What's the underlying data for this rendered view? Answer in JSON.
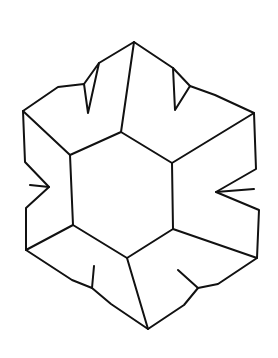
{
  "figure": {
    "stroke_color": "#111111",
    "background": "#ffffff",
    "outline": [
      [
        134,
        42
      ],
      [
        99,
        63
      ],
      [
        88,
        113
      ],
      [
        84,
        84
      ],
      [
        58,
        87
      ],
      [
        23,
        111
      ],
      [
        25,
        162
      ],
      [
        49,
        187
      ],
      [
        26,
        208
      ],
      [
        26,
        250
      ],
      [
        72,
        280
      ],
      [
        92,
        288
      ],
      [
        111,
        304
      ],
      [
        148,
        329
      ],
      [
        184,
        305
      ],
      [
        198,
        288
      ],
      [
        218,
        284
      ],
      [
        257,
        258
      ],
      [
        259,
        210
      ],
      [
        216,
        192
      ],
      [
        256,
        169
      ],
      [
        254,
        113
      ],
      [
        215,
        95
      ],
      [
        190,
        86
      ],
      [
        175,
        110
      ],
      [
        173,
        68
      ]
    ],
    "inner_hexagon": [
      [
        121,
        132
      ],
      [
        172,
        163
      ],
      [
        173,
        229
      ],
      [
        127,
        258
      ],
      [
        73,
        225
      ],
      [
        70,
        155
      ]
    ],
    "spokes": [
      [
        [
          134,
          42
        ],
        [
          121,
          132
        ]
      ],
      [
        [
          23,
          111
        ],
        [
          70,
          155
        ]
      ],
      [
        [
          254,
          113
        ],
        [
          172,
          163
        ]
      ],
      [
        [
          26,
          250
        ],
        [
          73,
          225
        ]
      ],
      [
        [
          257,
          258
        ],
        [
          173,
          229
        ]
      ],
      [
        [
          148,
          329
        ],
        [
          127,
          258
        ]
      ]
    ],
    "notch_lines": [
      [
        [
          84,
          84
        ],
        [
          99,
          63
        ]
      ],
      [
        [
          190,
          86
        ],
        [
          173,
          68
        ]
      ],
      [
        [
          30,
          185
        ],
        [
          49,
          187
        ]
      ],
      [
        [
          254,
          189
        ],
        [
          216,
          192
        ]
      ],
      [
        [
          94,
          266
        ],
        [
          92,
          288
        ]
      ],
      [
        [
          178,
          270
        ],
        [
          198,
          288
        ]
      ]
    ]
  }
}
